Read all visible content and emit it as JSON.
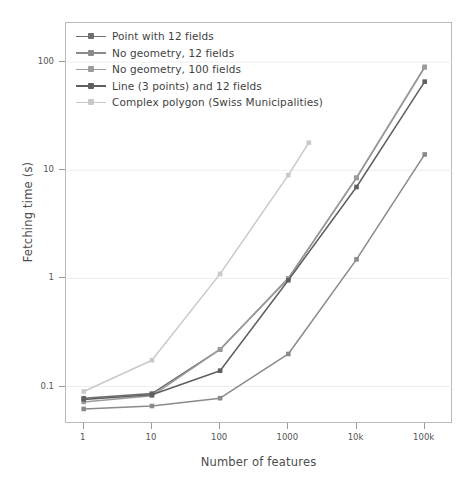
{
  "chart_data": {
    "type": "line",
    "title": "",
    "xlabel": "Number of features",
    "ylabel": "Fetching time (s)",
    "xscale": "log",
    "yscale": "log",
    "xlim": [
      0.55,
      260000
    ],
    "ylim": [
      0.045,
      230
    ],
    "grid": true,
    "grid_axis": "y",
    "legend_position": "upper left",
    "xticks": [
      1,
      10,
      100,
      1000,
      10000,
      100000
    ],
    "xticklabels": [
      "1",
      "10",
      "100",
      "1000",
      "10k",
      "100k"
    ],
    "yticks": [
      0.1,
      1,
      10,
      100
    ],
    "yticklabels": [
      "0.1",
      "1",
      "10",
      "100"
    ],
    "x": [
      1,
      10,
      100,
      1000,
      10000,
      100000
    ],
    "series": [
      {
        "name": "Point with 12 fields",
        "color": "#6e6e6e",
        "marker": "square",
        "x": [
          1,
          10,
          100,
          1000,
          10000,
          100000
        ],
        "values": [
          0.078,
          0.086,
          0.22,
          1.0,
          8.5,
          90.0
        ]
      },
      {
        "name": "No geometry, 12 fields",
        "color": "#8a8a8a",
        "marker": "square",
        "x": [
          1,
          10,
          100,
          1000,
          10000,
          100000
        ],
        "values": [
          0.062,
          0.066,
          0.078,
          0.2,
          1.5,
          14.0
        ]
      },
      {
        "name": "No geometry, 100 fields",
        "color": "#9c9c9c",
        "marker": "square",
        "x": [
          1,
          10,
          100,
          1000,
          10000,
          100000
        ],
        "values": [
          0.072,
          0.082,
          0.22,
          1.0,
          8.5,
          90.0
        ]
      },
      {
        "name": "Line (3 points) and 12 fields",
        "color": "#5f5f5f",
        "marker": "square",
        "x": [
          1,
          10,
          100,
          1000,
          10000,
          100000
        ],
        "values": [
          0.076,
          0.084,
          0.14,
          0.96,
          7.0,
          66.0
        ]
      },
      {
        "name": "Complex polygon (Swiss Municipalities)",
        "color": "#c9c9c9",
        "marker": "square",
        "x": [
          1,
          10,
          100,
          1000,
          2000
        ],
        "values": [
          0.09,
          0.175,
          1.1,
          9.0,
          18.0
        ]
      }
    ]
  },
  "axes": {
    "frame_color": "#b9b9b9",
    "gridline_color": "#ededed",
    "tick_color": "#9a9a9a",
    "text_color": "#555555"
  }
}
